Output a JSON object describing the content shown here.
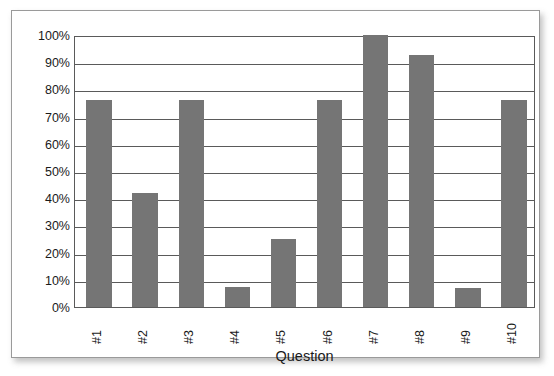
{
  "chart_data": {
    "type": "bar",
    "title": "",
    "subtitle": "",
    "xlabel": "Question",
    "ylabel": "",
    "categories": [
      "#1",
      "#2",
      "#3",
      "#4",
      "#5",
      "#6",
      "#7",
      "#8",
      "#9",
      "#10"
    ],
    "values": [
      76,
      42,
      76,
      7.5,
      25,
      76,
      100,
      92.5,
      7,
      76
    ],
    "value_format": "percent",
    "ylim": [
      0,
      100
    ],
    "ytick_labels": [
      "100%",
      "90%",
      "80%",
      "70%",
      "60%",
      "50%",
      "40%",
      "30%",
      "20%",
      "10%",
      "0%"
    ],
    "ytick_values": [
      100,
      90,
      80,
      70,
      60,
      50,
      40,
      30,
      20,
      10,
      0
    ],
    "grid": true,
    "grid_axis": "y",
    "legend": false,
    "legend_position": "none",
    "series": [
      {
        "name": "Percent correct",
        "values": [
          76,
          42,
          76,
          7.5,
          25,
          76,
          100,
          92.5,
          7,
          76
        ]
      }
    ],
    "annotations": []
  },
  "style": {
    "bar_color": "#757575",
    "axis_color": "#5a5a5a",
    "grid_color": "#5a5a5a",
    "text_color": "#1a1a1a",
    "frame_color": "#9a9a9a",
    "plot_background": "#ffffff",
    "page_background": "#ffffff"
  },
  "axis": {
    "x_title": "Question",
    "y_title": ""
  }
}
